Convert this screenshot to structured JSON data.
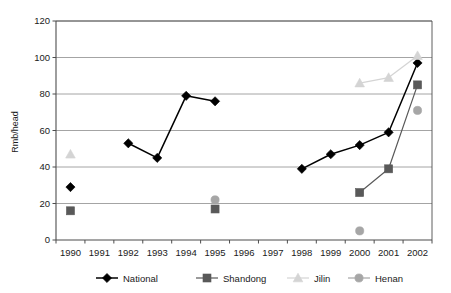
{
  "chart_data": {
    "type": "line",
    "title": "",
    "xlabel": "",
    "ylabel": "Rmb/head",
    "categories": [
      "1990",
      "1991",
      "1992",
      "1993",
      "1994",
      "1995",
      "1996",
      "1997",
      "1998",
      "1999",
      "2000",
      "2001",
      "2002"
    ],
    "ylim": [
      0,
      120
    ],
    "ytick_values": [
      0,
      20,
      40,
      60,
      80,
      100,
      120
    ],
    "ytick_labels": [
      "0",
      "20",
      "40",
      "60",
      "80",
      "100",
      "120"
    ],
    "grid": "horizontal",
    "legend_position": "bottom",
    "series": [
      {
        "name": "National",
        "color": "#000000",
        "marker": "diamond",
        "values": [
          29,
          null,
          53,
          45,
          79,
          76,
          null,
          null,
          39,
          47,
          52,
          59,
          97
        ]
      },
      {
        "name": "Shandong",
        "color": "#595959",
        "marker": "square",
        "values": [
          16,
          null,
          null,
          null,
          null,
          17,
          null,
          null,
          null,
          null,
          26,
          39,
          85
        ]
      },
      {
        "name": "Jilin",
        "color": "#d4d4d4",
        "marker": "triangle",
        "values": [
          47,
          null,
          null,
          null,
          null,
          null,
          null,
          null,
          null,
          null,
          86,
          89,
          101
        ]
      },
      {
        "name": "Henan",
        "color": "#a6a6a6",
        "marker": "circle",
        "values": [
          null,
          null,
          null,
          null,
          null,
          22,
          null,
          null,
          null,
          null,
          5,
          null,
          71
        ]
      }
    ]
  },
  "legend": {
    "items": [
      {
        "label": "National"
      },
      {
        "label": "Shandong"
      },
      {
        "label": "Jilin"
      },
      {
        "label": "Henan"
      }
    ]
  },
  "axes": {
    "y_title": "Rmb/head"
  }
}
